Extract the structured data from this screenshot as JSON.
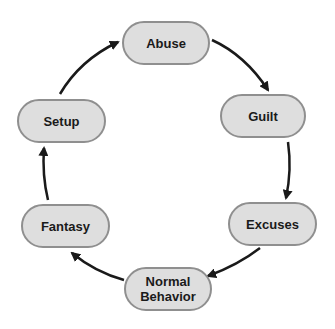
{
  "diagram": {
    "type": "cycle",
    "nodes": [
      {
        "id": "abuse",
        "label": "Abuse"
      },
      {
        "id": "guilt",
        "label": "Guilt"
      },
      {
        "id": "excuses",
        "label": "Excuses"
      },
      {
        "id": "normal",
        "label": "Normal Behavior"
      },
      {
        "id": "fantasy",
        "label": "Fantasy"
      },
      {
        "id": "setup",
        "label": "Setup"
      }
    ],
    "edges": [
      [
        "abuse",
        "guilt"
      ],
      [
        "guilt",
        "excuses"
      ],
      [
        "excuses",
        "normal"
      ],
      [
        "normal",
        "fantasy"
      ],
      [
        "fantasy",
        "setup"
      ],
      [
        "setup",
        "abuse"
      ]
    ],
    "colors": {
      "node_fill": "#dedede",
      "node_border": "#8f8f8f",
      "arrow": "#1a1a1a"
    }
  }
}
